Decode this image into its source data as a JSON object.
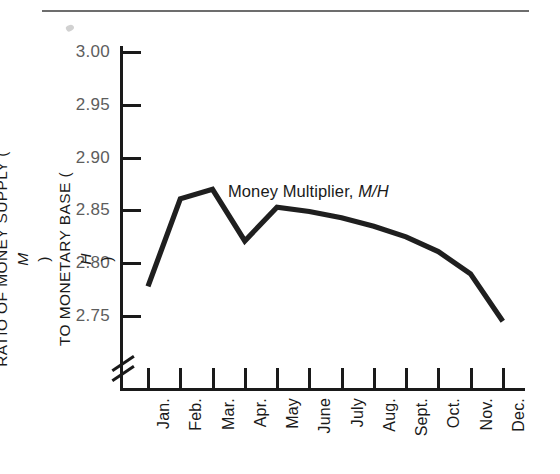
{
  "figure": {
    "has_top_rule": true,
    "axis_break": true,
    "line_color": "#1f1f1f",
    "label_color": "#5d5d5d",
    "axis_color": "#1a1a1a"
  },
  "annotation": {
    "prefix": "Money Multiplier, ",
    "symbol": "M/H"
  },
  "y_axis_title": {
    "line1_prefix": "RATIO OF MONEY SUPPLY (",
    "line1_symbol": "M",
    "line1_suffix": ")",
    "line2_prefix": "TO MONETARY BASE (",
    "line2_symbol": "H",
    "line2_suffix": ")"
  },
  "chart_data": {
    "type": "line",
    "title": "",
    "subtitle": "",
    "xlabel": "",
    "ylabel": "RATIO OF MONEY SUPPLY (M) TO MONETARY BASE (H)",
    "categories": [
      "Jan.",
      "Feb.",
      "Mar.",
      "Apr.",
      "May",
      "June",
      "July",
      "Aug.",
      "Sept.",
      "Oct.",
      "Nov.",
      "Dec."
    ],
    "series": [
      {
        "name": "Money Multiplier, M/H",
        "values": [
          2.778,
          2.861,
          2.87,
          2.821,
          2.853,
          2.849,
          2.843,
          2.835,
          2.825,
          2.811,
          2.79,
          2.745
        ]
      }
    ],
    "ylim": [
      2.72,
      3.0
    ],
    "yticks": [
      2.75,
      2.8,
      2.85,
      2.9,
      2.95,
      3.0
    ],
    "ytick_labels": [
      "2.75",
      "2.80",
      "2.85",
      "2.90",
      "2.95",
      "3.00"
    ],
    "grid": false,
    "legend": "none",
    "axis_break_on_y": true,
    "annotations": [
      {
        "text": "Money Multiplier, M/H",
        "x": "Apr.",
        "y": 2.878
      }
    ]
  }
}
